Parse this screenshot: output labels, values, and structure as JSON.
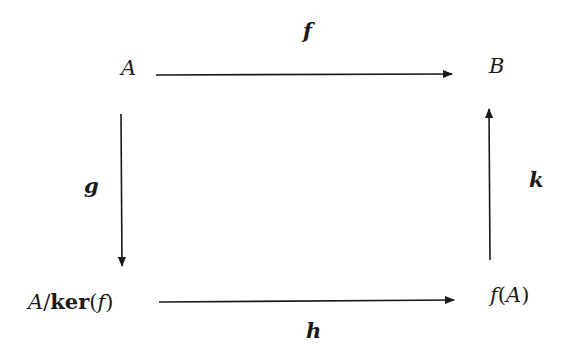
{
  "diagram": {
    "type": "commutative-diagram",
    "nodes": {
      "top_left": "A",
      "top_right": "B",
      "bottom_left": {
        "prefix": "A",
        "slash": "/",
        "ker": "ker",
        "open": "(",
        "arg": "f",
        "close": ")"
      },
      "bottom_right": {
        "fn": "f",
        "open": "(",
        "arg": "A",
        "close": ")"
      }
    },
    "arrows": {
      "top": {
        "label": "f",
        "from": "A",
        "to": "B"
      },
      "left": {
        "label": "g",
        "from": "A",
        "to": "A/ker(f)"
      },
      "bottom": {
        "label": "h",
        "from": "A/ker(f)",
        "to": "f(A)"
      },
      "right": {
        "label": "k",
        "from": "f(A)",
        "to": "B"
      }
    },
    "stroke_color": "#1a1a1a"
  }
}
